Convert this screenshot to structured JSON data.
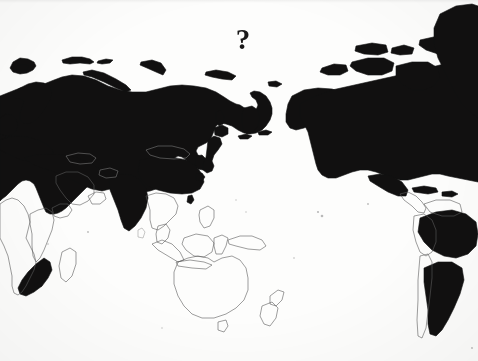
{
  "figure": {
    "kind": "world-map",
    "projection": "pacific-centered equirectangular",
    "title": "",
    "annotation_label": "?",
    "background_color": "#fdfdfc",
    "fill_color": "#111010",
    "outline_color": "#5d5d5d",
    "legend": [],
    "axis_labels": [],
    "regions_filled": [
      "Russia",
      "Europe",
      "Scandinavia",
      "Iceland",
      "United Kingdom",
      "Ireland",
      "Svalbard",
      "Turkey",
      "Iran",
      "China",
      "India",
      "Pakistan",
      "Japan",
      "Korea",
      "Taiwan",
      "Kamchatka",
      "Alaska",
      "Canada",
      "United States",
      "Greenland",
      "Mexico",
      "Cuba",
      "Brazil",
      "Argentina",
      "South Africa"
    ],
    "regions_outline_only": [
      "Africa",
      "Saudi Arabia",
      "Arabian Peninsula",
      "Mongolia",
      "Kazakhstan",
      "Afghanistan",
      "Southeast Asia",
      "Indonesia",
      "Philippines",
      "Papua New Guinea",
      "Australia",
      "New Zealand",
      "Madagascar",
      "Peru",
      "Bolivia",
      "Chile",
      "Colombia",
      "Venezuela",
      "Central America"
    ]
  },
  "annotation": {
    "text": "?",
    "position": {
      "x": 243,
      "y": 40
    },
    "color": "#1a1919"
  }
}
